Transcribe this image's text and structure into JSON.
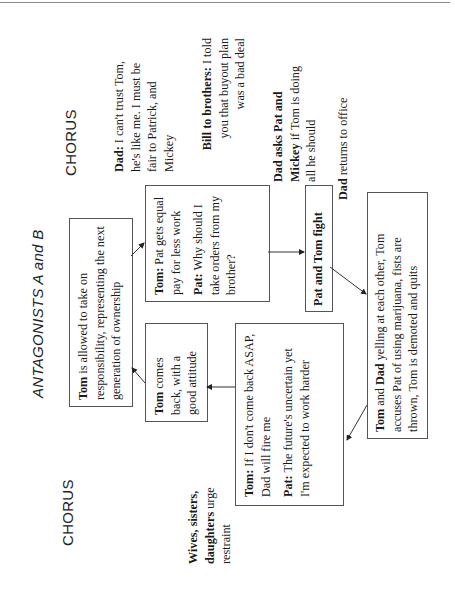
{
  "layout_note_orientation": "rotated-90-ccw",
  "titles": {
    "chorus_right": "CHORUS",
    "antagonists": "ANTAGONISTS A and B",
    "antagonists_main": "ANTAGONISTS A ",
    "antagonists_and": "and",
    "antagonists_b": " B",
    "chorus_left": "CHORUS"
  },
  "chorus_right": {
    "dad": {
      "speaker": "Dad:",
      "text": " I can't trust Tom, he's like me. I must be fair to Patrick, and Mickey"
    },
    "bill": {
      "speaker": "Bill to brothers:",
      "text": " I told you that buyout plan was a bad deal"
    },
    "dad_asks": {
      "speaker": "Dad asks Pat and Mickey",
      "text": " if Tom is doing all he should"
    },
    "dad_returns": {
      "speaker": "Dad",
      "text": " returns to office"
    }
  },
  "chorus_left": {
    "wives": {
      "speaker": "Wives, sisters, daughters",
      "text": " urge restraint"
    }
  },
  "boxes": {
    "tom_allowed": {
      "speaker": "Tom",
      "text": " is allowed to take on responsibility, representing the next generation of ownership"
    },
    "pat_gets": {
      "line1_speaker": "Tom:",
      "line1_text": " Pat gets equal pay for less work",
      "line2_speaker": "Pat:",
      "line2_text": " Why should I take orders from my brother?"
    },
    "pat_tom_fight": {
      "speaker": "Pat and Tom fight"
    },
    "tom_dad_yelling": {
      "speaker1": "Tom",
      "and": " and ",
      "speaker2": "Dad",
      "text": " yelling at each other, Tom accuses Pat of using marijuana, fists are thrown, Tom is demoted and quits"
    },
    "tom_if": {
      "line1_speaker": "Tom:",
      "line1_text": " If I don't come back ASAP, Dad will fire me",
      "line2_speaker": "Pat:",
      "line2_text": " The future's uncertain yet I'm expected to work harder"
    },
    "tom_comes_back": {
      "speaker": "Tom",
      "text": " comes back, with a good attitude"
    }
  },
  "flow": [
    "tom_allowed -> pat_gets",
    "pat_gets -> pat_tom_fight",
    "pat_tom_fight -> tom_dad_yelling",
    "tom_dad_yelling -> tom_if",
    "tom_if -> tom_comes_back",
    "tom_comes_back -> tom_allowed"
  ],
  "colors": {
    "text": "#1a1a1a",
    "border": "#555555",
    "rule": "#8a8a8a"
  }
}
